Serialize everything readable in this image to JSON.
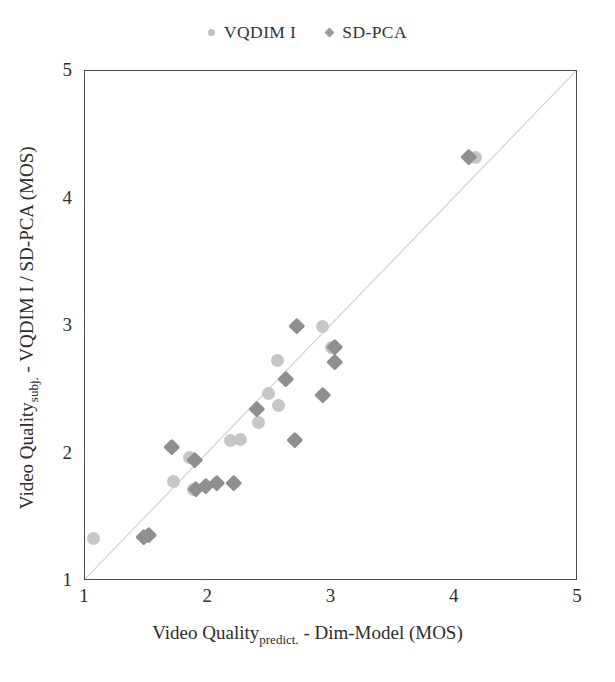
{
  "chart_data": {
    "type": "scatter",
    "title": "",
    "xlabel": "Video Quality_predict. - Dim-Model (MOS)",
    "ylabel": "Video Quality_subj. - VQDIM I / SD-PCA (MOS)",
    "xlim": [
      1,
      5
    ],
    "ylim": [
      1,
      5
    ],
    "xticks": [
      "1",
      "2",
      "3",
      "4",
      "5"
    ],
    "yticks": [
      "1",
      "2",
      "3",
      "4",
      "5"
    ],
    "grid": false,
    "legend_position": "top-center",
    "reference_line": {
      "name": "identity-line",
      "from": [
        1,
        1
      ],
      "to": [
        5,
        5
      ],
      "color": "#d2d2d2"
    },
    "series": [
      {
        "name": "VQDIM I",
        "marker": "circle",
        "color": "#c6c6c6",
        "points": [
          [
            1.07,
            1.33
          ],
          [
            1.72,
            1.78
          ],
          [
            1.85,
            1.97
          ],
          [
            1.88,
            1.72
          ],
          [
            2.18,
            2.1
          ],
          [
            2.26,
            2.11
          ],
          [
            2.41,
            2.24
          ],
          [
            2.49,
            2.47
          ],
          [
            2.57,
            2.38
          ],
          [
            2.56,
            2.73
          ],
          [
            2.93,
            3.0
          ],
          [
            3.0,
            2.83
          ],
          [
            4.17,
            4.32
          ]
        ]
      },
      {
        "name": "SD-PCA",
        "marker": "diamond",
        "color": "#8f8f8f",
        "points": [
          [
            1.48,
            1.35
          ],
          [
            1.52,
            1.36
          ],
          [
            1.7,
            2.05
          ],
          [
            1.89,
            1.95
          ],
          [
            1.9,
            1.72
          ],
          [
            1.98,
            1.75
          ],
          [
            2.07,
            1.77
          ],
          [
            2.21,
            1.77
          ],
          [
            2.39,
            2.35
          ],
          [
            2.63,
            2.59
          ],
          [
            2.7,
            2.11
          ],
          [
            2.72,
            3.0
          ],
          [
            2.93,
            2.46
          ],
          [
            3.03,
            2.84
          ],
          [
            3.03,
            2.72
          ],
          [
            4.11,
            4.33
          ]
        ]
      }
    ]
  },
  "legend": {
    "entries": [
      {
        "label": "VQDIM I",
        "marker": "circle"
      },
      {
        "label": "SD-PCA",
        "marker": "diamond"
      }
    ]
  },
  "axes": {
    "x_title_main": "Video Quality",
    "x_title_sub": "predict.",
    "x_title_rest": "- Dim-Model (MOS)",
    "y_title_main": "Video Quality",
    "y_title_sub": "subj.",
    "y_title_rest": "- VQDIM I / SD-PCA (MOS)"
  }
}
